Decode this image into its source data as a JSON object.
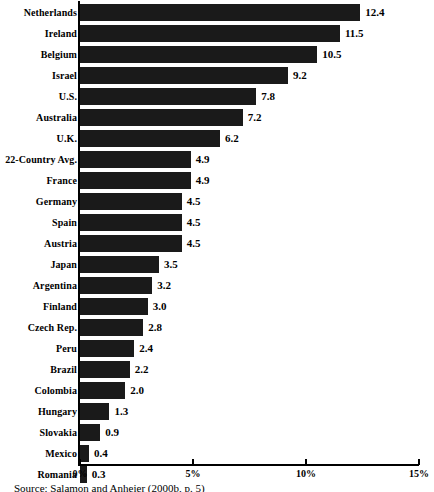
{
  "chart_data": {
    "type": "bar",
    "orientation": "horizontal",
    "title": "",
    "xlabel": "",
    "ylabel": "",
    "xlim": [
      0,
      15
    ],
    "xticks": [
      0,
      5,
      10,
      15
    ],
    "xtick_labels": [
      "0%",
      "5%",
      "10%",
      "15%"
    ],
    "grid": false,
    "legend": false,
    "bar_color": "#1a1a1a",
    "categories": [
      "Netherlands",
      "Ireland",
      "Belgium",
      "Israel",
      "U.S.",
      "Australia",
      "U.K.",
      "22-Country Avg.",
      "France",
      "Germany",
      "Spain",
      "Austria",
      "Japan",
      "Argentina",
      "Finland",
      "Czech Rep.",
      "Peru",
      "Brazil",
      "Colombia",
      "Hungary",
      "Slovakia",
      "Mexico",
      "Romania"
    ],
    "values": [
      12.4,
      11.5,
      10.5,
      9.2,
      7.8,
      7.2,
      6.2,
      4.9,
      4.9,
      4.5,
      4.5,
      4.5,
      3.5,
      3.2,
      3.0,
      2.8,
      2.4,
      2.2,
      2.0,
      1.3,
      0.9,
      0.4,
      0.3
    ],
    "value_labels": [
      "12.4",
      "11.5",
      "10.5",
      "9.2",
      "7.8",
      "7.2",
      "6.2",
      "4.9",
      "4.9",
      "4.5",
      "4.5",
      "4.5",
      "3.5",
      "3.2",
      "3.0",
      "2.8",
      "2.4",
      "2.2",
      "2.0",
      "1.3",
      "0.9",
      "0.4",
      "0.3"
    ]
  },
  "source": {
    "text": "Source: Salamon and Anheier (2000b, p. 5)"
  }
}
